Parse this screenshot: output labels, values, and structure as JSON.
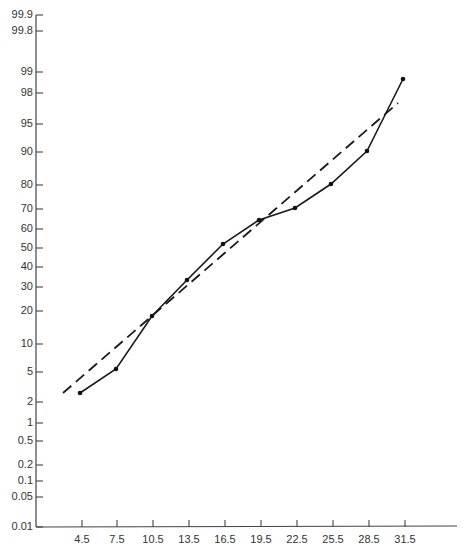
{
  "chart_data": {
    "type": "line",
    "title": "",
    "xlabel": "",
    "ylabel": "",
    "y_scale": "normal-probability",
    "grid": false,
    "legend": null,
    "x": [
      4.5,
      7.5,
      10.5,
      13.5,
      16.5,
      19.5,
      22.5,
      25.5,
      28.5,
      31.5
    ],
    "x_tick_labels": [
      "4.5",
      "7.5",
      "10.5",
      "13.5",
      "16.5",
      "19.5",
      "22.5",
      "25.5",
      "28.5",
      "31.5"
    ],
    "y_tick_labels": [
      "0.01",
      "0.05",
      "0.1",
      "0.2",
      "0.5",
      "1",
      "2",
      "5",
      "10",
      "20",
      "30",
      "40",
      "50",
      "60",
      "70",
      "80",
      "90",
      "95",
      "98",
      "99",
      "99.8",
      "99.9"
    ],
    "ylim": [
      0.01,
      99.9
    ],
    "series": [
      {
        "name": "Observed cumulative %",
        "style": "solid-with-markers",
        "values": [
          2.5,
          5.2,
          18,
          33,
          52,
          64,
          70,
          80,
          90,
          98.8
        ]
      },
      {
        "name": "Fitted normal line",
        "style": "dashed",
        "endpoints": [
          {
            "x": 3.5,
            "y": 2.6
          },
          {
            "x": 31.2,
            "y": 97
          }
        ]
      }
    ]
  },
  "layout": {
    "y_axis_x": 36,
    "x_axis_y": 527,
    "x_axis_end": 457,
    "y_axis_top": 15,
    "y_tick_px": {
      "0.01": 527,
      "0.05": 497,
      "0.1": 481,
      "0.2": 465,
      "0.5": 441,
      "1": 423,
      "2": 402,
      "5": 372,
      "10": 344,
      "20": 311,
      "30": 287,
      "40": 267,
      "50": 248,
      "60": 229,
      "70": 209,
      "80": 185,
      "90": 152,
      "95": 124,
      "98": 93,
      "99": 72,
      "99.8": 31,
      "99.9": 15
    },
    "x_tick_px": [
      82,
      117,
      153,
      189,
      225,
      261,
      297,
      333,
      369,
      405
    ],
    "points_px": [
      [
        80,
        393
      ],
      [
        116,
        369
      ],
      [
        152,
        316
      ],
      [
        187,
        280
      ],
      [
        223,
        244
      ],
      [
        259,
        220
      ],
      [
        295,
        208
      ],
      [
        331,
        184
      ],
      [
        367,
        151
      ],
      [
        403,
        79
      ]
    ],
    "fit_px": [
      [
        63,
        393
      ],
      [
        398,
        103
      ]
    ]
  },
  "colors": {
    "ink": "#1a1a1a",
    "axis": "#444444",
    "label": "#333333",
    "background": "#ffffff"
  }
}
